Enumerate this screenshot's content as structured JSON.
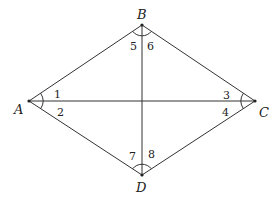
{
  "diagram": {
    "type": "rhombus-with-diagonals",
    "vertices": [
      {
        "label": "A",
        "x": 29,
        "y": 101
      },
      {
        "label": "B",
        "x": 142,
        "y": 25
      },
      {
        "label": "C",
        "x": 255,
        "y": 101
      },
      {
        "label": "D",
        "x": 142,
        "y": 175
      }
    ],
    "angles": [
      {
        "label": "1",
        "at": "A",
        "side": "upper"
      },
      {
        "label": "2",
        "at": "A",
        "side": "lower"
      },
      {
        "label": "3",
        "at": "C",
        "side": "upper"
      },
      {
        "label": "4",
        "at": "C",
        "side": "lower"
      },
      {
        "label": "5",
        "at": "B",
        "side": "left"
      },
      {
        "label": "6",
        "at": "B",
        "side": "right"
      },
      {
        "label": "7",
        "at": "D",
        "side": "left"
      },
      {
        "label": "8",
        "at": "D",
        "side": "right"
      }
    ],
    "line_color": "#333333"
  }
}
